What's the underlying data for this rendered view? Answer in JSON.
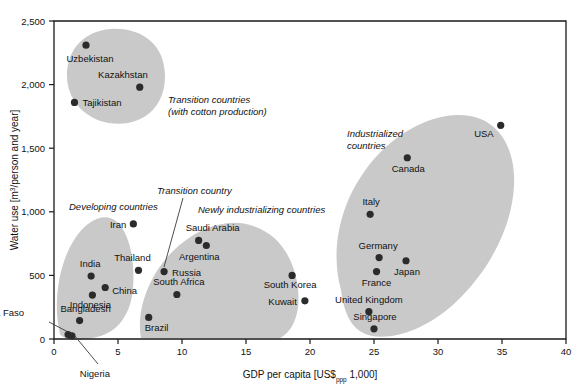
{
  "chart_data": {
    "type": "scatter",
    "title": "",
    "xlabel": "GDP per capita [US$ppp 1,000]",
    "xlabel_parts": {
      "pre": "GDP per capita [US$",
      "sub": "ppp",
      "post": " 1,000]"
    },
    "ylabel": "Water use [m3/person and year]",
    "ylabel_parts": {
      "pre": "Water use [m",
      "sup": "3",
      "post": "/person and year]"
    },
    "xlim": [
      0,
      40
    ],
    "ylim": [
      0,
      2500
    ],
    "xticks": [
      0,
      5,
      10,
      15,
      20,
      25,
      30,
      35,
      40
    ],
    "xtick_labels": [
      "0",
      "5",
      "10",
      "15",
      "20",
      "25",
      "30",
      "35",
      "40"
    ],
    "yticks": [
      0,
      500,
      1000,
      1500,
      2000,
      2500
    ],
    "ytick_labels": [
      "0",
      "500",
      "1,000",
      "1,500",
      "2,000",
      "2,500"
    ],
    "grid": false,
    "legend": "none",
    "marker_color": "#2b2b2b",
    "cluster_color": "#c9c9c9",
    "points": [
      {
        "name": "Uzbekistan",
        "x": 2.5,
        "y": 2310,
        "label_anchor": "middle",
        "label_dx": 4,
        "label_dy": 17
      },
      {
        "name": "Kazakhstan",
        "x": 6.7,
        "y": 1980,
        "label_anchor": "end",
        "label_dx": 8,
        "label_dy": -9
      },
      {
        "name": "Tajikistan",
        "x": 1.6,
        "y": 1860,
        "label_anchor": "start",
        "label_dx": 8,
        "label_dy": 4
      },
      {
        "name": "Iran",
        "x": 6.2,
        "y": 905,
        "label_anchor": "end",
        "label_dx": -7,
        "label_dy": 4
      },
      {
        "name": "Thailand",
        "x": 6.6,
        "y": 540,
        "label_anchor": "middle",
        "label_dx": -6,
        "label_dy": -9
      },
      {
        "name": "India",
        "x": 2.9,
        "y": 495,
        "label_anchor": "middle",
        "label_dx": -1,
        "label_dy": -9
      },
      {
        "name": "China",
        "x": 4.0,
        "y": 405,
        "label_anchor": "start",
        "label_dx": 7,
        "label_dy": 7
      },
      {
        "name": "Indonesia",
        "x": 3.0,
        "y": 345,
        "label_anchor": "middle",
        "label_dx": -2,
        "label_dy": 13
      },
      {
        "name": "Bangladesh",
        "x": 2.0,
        "y": 145,
        "label_anchor": "middle",
        "label_dx": 6,
        "label_dy": -9
      },
      {
        "name": "Burkina Faso",
        "x": 1.1,
        "y": 35,
        "label_anchor": "end",
        "label_dx": -44,
        "label_dy": -19
      },
      {
        "name": "Nigeria",
        "x": 1.4,
        "y": 25,
        "label_anchor": "middle",
        "label_dx": 23,
        "label_dy": 41
      },
      {
        "name": "Russia",
        "x": 8.6,
        "y": 530,
        "label_anchor": "start",
        "label_dx": 8,
        "label_dy": 4
      },
      {
        "name": "Saudi Arabia",
        "x": 11.3,
        "y": 775,
        "label_anchor": "middle",
        "label_dx": 14,
        "label_dy": -9
      },
      {
        "name": "Argentina",
        "x": 11.9,
        "y": 735,
        "label_anchor": "middle",
        "label_dx": -7,
        "label_dy": 14
      },
      {
        "name": "South Africa",
        "x": 9.6,
        "y": 350,
        "label_anchor": "middle",
        "label_dx": 2,
        "label_dy": -9
      },
      {
        "name": "Brazil",
        "x": 7.4,
        "y": 170,
        "label_anchor": "start",
        "label_dx": -4,
        "label_dy": 14
      },
      {
        "name": "South Korea",
        "x": 18.6,
        "y": 500,
        "label_anchor": "middle",
        "label_dx": -2,
        "label_dy": 13
      },
      {
        "name": "Kuwait",
        "x": 19.6,
        "y": 300,
        "label_anchor": "end",
        "label_dx": -8,
        "label_dy": 4
      },
      {
        "name": "USA",
        "x": 34.9,
        "y": 1680,
        "label_anchor": "end",
        "label_dx": -7,
        "label_dy": 12
      },
      {
        "name": "Canada",
        "x": 27.6,
        "y": 1425,
        "label_anchor": "middle",
        "label_dx": 1,
        "label_dy": 14
      },
      {
        "name": "Italy",
        "x": 24.7,
        "y": 980,
        "label_anchor": "middle",
        "label_dx": 1,
        "label_dy": -9
      },
      {
        "name": "Germany",
        "x": 25.4,
        "y": 640,
        "label_anchor": "middle",
        "label_dx": -1,
        "label_dy": -9
      },
      {
        "name": "Japan",
        "x": 27.5,
        "y": 615,
        "label_anchor": "middle",
        "label_dx": 1,
        "label_dy": 14
      },
      {
        "name": "France",
        "x": 25.2,
        "y": 530,
        "label_anchor": "middle",
        "label_dx": 0,
        "label_dy": 14
      },
      {
        "name": "United Kingdom",
        "x": 24.6,
        "y": 215,
        "label_anchor": "middle",
        "label_dx": 0,
        "label_dy": -9
      },
      {
        "name": "Singapore",
        "x": 25.0,
        "y": 80,
        "label_anchor": "middle",
        "label_dx": 1,
        "label_dy": -9
      }
    ],
    "clusters": [
      {
        "id": "transition-cotton",
        "label": "Transition countries\n(with cotton production)",
        "label_lines": [
          "Transition countries",
          "(with cotton production)"
        ],
        "label_x": 168,
        "label_y": 103
      },
      {
        "id": "developing",
        "label": "Developing countries",
        "label_lines": [
          "Developing countries"
        ],
        "label_x": 69,
        "label_y": 210
      },
      {
        "id": "newly-industrializing",
        "label": "Newly industrializing countries",
        "label_lines": [
          "Newly industrializing countries"
        ],
        "label_x": 198,
        "label_y": 213
      },
      {
        "id": "industrialized",
        "label": "Industrialized countries",
        "label_lines": [
          "Industrialized",
          "countries"
        ],
        "label_x": 347,
        "label_y": 137
      }
    ],
    "annotations": [
      {
        "id": "transition-country",
        "text": "Transition country",
        "target": "Russia",
        "label_x": 157,
        "label_y": 194
      },
      {
        "id": "burkina-faso-callout",
        "text": "Burkina Faso",
        "target": "Burkina Faso"
      },
      {
        "id": "nigeria-callout",
        "text": "Nigeria",
        "target": "Nigeria"
      }
    ]
  }
}
